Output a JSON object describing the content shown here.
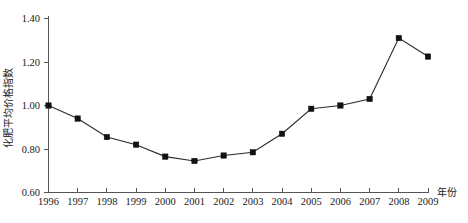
{
  "chart_data": {
    "type": "line",
    "title": "",
    "xlabel": "年份",
    "ylabel": "化肥平均价格指数",
    "categories": [
      "1996",
      "1997",
      "1998",
      "1999",
      "2000",
      "2001",
      "2002",
      "2003",
      "2004",
      "2005",
      "2006",
      "2007",
      "2008",
      "2009"
    ],
    "values": [
      1.0,
      0.94,
      0.855,
      0.82,
      0.765,
      0.745,
      0.77,
      0.785,
      0.87,
      0.985,
      1.0,
      1.03,
      1.31,
      1.225
    ],
    "series": [
      {
        "name": "化肥平均价格指数",
        "values": [
          1.0,
          0.94,
          0.855,
          0.82,
          0.765,
          0.745,
          0.77,
          0.785,
          0.87,
          0.985,
          1.0,
          1.03,
          1.31,
          1.225
        ]
      }
    ],
    "ylim": [
      0.6,
      1.4
    ],
    "yticks": [
      0.6,
      0.8,
      1.0,
      1.2,
      1.4
    ],
    "ytick_labels": [
      "0.60",
      "0.80",
      "1.00",
      "1.20",
      "1.40"
    ],
    "xticks": [
      "1996",
      "1997",
      "1998",
      "1999",
      "2000",
      "2001",
      "2002",
      "2003",
      "2004",
      "2005",
      "2006",
      "2007",
      "2008",
      "2009"
    ],
    "grid": false,
    "legend": false,
    "legend_position": "none",
    "marker": "square",
    "line_color": "#2b2b2b",
    "marker_color": "#111111",
    "axis_color": "#555555"
  },
  "axes": {
    "y_title": "化肥平均价格指数",
    "x_title": "年份"
  },
  "colors": {
    "background": "#ffffff",
    "line": "#2b2b2b",
    "marker": "#111111",
    "axis": "#555555",
    "text": "#1a1a1a"
  }
}
